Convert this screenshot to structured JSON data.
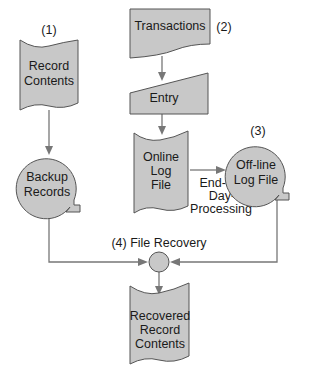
{
  "diagram": {
    "type": "system-flowchart",
    "colors": {
      "shape_fill": "#c8c8c8",
      "shape_stroke": "#555555",
      "connector": "#777777",
      "text": "#1a1a1a"
    },
    "nodes": {
      "record_contents": {
        "step": "(1)",
        "line1": "Record",
        "line2": "Contents",
        "shape": "document"
      },
      "backup_records": {
        "line1": "Backup",
        "line2": "Records",
        "shape": "magnetic-tape"
      },
      "transactions": {
        "step": "(2)",
        "line1": "Transactions",
        "shape": "document"
      },
      "entry": {
        "line1": "Entry",
        "shape": "manual-input"
      },
      "online_log": {
        "line1": "Online",
        "line2": "Log",
        "line3": "File",
        "shape": "document"
      },
      "offline_log": {
        "step": "(3)",
        "line1": "Off-line",
        "line2": "Log File",
        "shape": "magnetic-tape"
      },
      "file_recovery": {
        "step_label": "(4) File Recovery",
        "shape": "connector-circle"
      },
      "recovered": {
        "line1": "Recovered",
        "line2": "Record",
        "line3": "Contents",
        "shape": "document"
      }
    },
    "edge_labels": {
      "end_of_day": {
        "line1": "End-of-",
        "line2": "Day-",
        "line3": "Processing"
      }
    },
    "edges": [
      {
        "from": "record_contents",
        "to": "backup_records"
      },
      {
        "from": "transactions",
        "to": "entry"
      },
      {
        "from": "entry",
        "to": "online_log"
      },
      {
        "from": "online_log",
        "to": "offline_log",
        "label": "End-of-Day-Processing"
      },
      {
        "from": "backup_records",
        "to": "file_recovery"
      },
      {
        "from": "offline_log",
        "to": "file_recovery"
      },
      {
        "from": "file_recovery",
        "to": "recovered"
      }
    ]
  }
}
